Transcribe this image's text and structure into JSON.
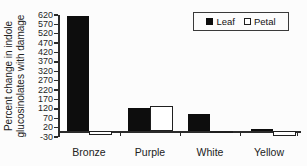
{
  "figure": {
    "background": "#fcfcfc",
    "axis_color": "#2b2b2b",
    "text_color": "#1c1c1c",
    "leaf_color": "#0d0d0d",
    "petal_color": "#ffffff"
  },
  "chart_data": {
    "type": "bar",
    "title": "",
    "xlabel": "",
    "ylabel": "Percent change in indole glucosinolates with damage",
    "ylabel_lines": [
      "Percent change in indole",
      "glucosinolates with damage"
    ],
    "categories": [
      "Bronze",
      "Purple",
      "White",
      "Yellow"
    ],
    "series": [
      {
        "name": "Leaf",
        "fill": "#0d0d0d",
        "values": [
          615,
          125,
          95,
          15
        ]
      },
      {
        "name": "Petal",
        "fill": "#ffffff",
        "values": [
          -20,
          135,
          -10,
          -25
        ]
      }
    ],
    "yticks": [
      620,
      570,
      520,
      470,
      420,
      370,
      320,
      270,
      220,
      170,
      120,
      70,
      20,
      -30
    ],
    "ylim": [
      -30,
      620
    ],
    "baseline": 0,
    "grid": false,
    "legend_position": "top-right"
  }
}
